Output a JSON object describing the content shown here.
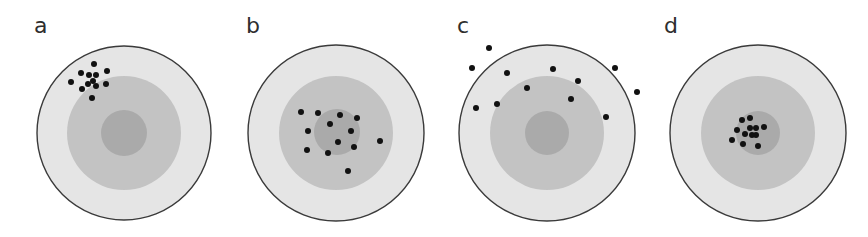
{
  "colors": {
    "outer_ring": "#e5e5e5",
    "middle_ring": "#c3c3c3",
    "inner_ring": "#aaaaaa",
    "outline": "#3a3a3a",
    "dot": "#111111",
    "label": "#2e2e2e"
  },
  "targets": [
    {
      "label": "a",
      "label_pos": [
        34,
        33
      ],
      "center": [
        124,
        133
      ],
      "r_outer": 87,
      "r_middle": 57,
      "r_inner": 23,
      "dots": [
        [
          94,
          64
        ],
        [
          81,
          73
        ],
        [
          89,
          75
        ],
        [
          96,
          75
        ],
        [
          107,
          71
        ],
        [
          71,
          82
        ],
        [
          93,
          81
        ],
        [
          88,
          84
        ],
        [
          96,
          86
        ],
        [
          106,
          84
        ],
        [
          82,
          89
        ],
        [
          92,
          98
        ]
      ]
    },
    {
      "label": "b",
      "label_pos": [
        246,
        33
      ],
      "center": [
        336,
        133
      ],
      "r_outer": 88,
      "r_middle": 57,
      "r_inner": 23,
      "inner_center": [
        337,
        132
      ],
      "dots": [
        [
          301,
          112
        ],
        [
          318,
          113
        ],
        [
          340,
          115
        ],
        [
          357,
          118
        ],
        [
          330,
          124
        ],
        [
          308,
          131
        ],
        [
          351,
          131
        ],
        [
          380,
          141
        ],
        [
          338,
          142
        ],
        [
          354,
          147
        ],
        [
          307,
          150
        ],
        [
          328,
          153
        ],
        [
          348,
          171
        ]
      ]
    },
    {
      "label": "c",
      "label_pos": [
        457,
        33
      ],
      "center": [
        547,
        133
      ],
      "r_outer": 88,
      "r_middle": 57,
      "r_inner": 22,
      "dots": [
        [
          489,
          48
        ],
        [
          472,
          68
        ],
        [
          507,
          73
        ],
        [
          553,
          69
        ],
        [
          615,
          68
        ],
        [
          578,
          81
        ],
        [
          527,
          88
        ],
        [
          637,
          92
        ],
        [
          476,
          108
        ],
        [
          497,
          104
        ],
        [
          571,
          99
        ],
        [
          606,
          117
        ]
      ]
    },
    {
      "label": "d",
      "label_pos": [
        664,
        33
      ],
      "center": [
        758,
        133
      ],
      "r_outer": 88,
      "r_middle": 57,
      "r_inner": 22,
      "dots": [
        [
          742,
          120
        ],
        [
          750,
          118
        ],
        [
          737,
          130
        ],
        [
          745,
          134
        ],
        [
          750,
          128
        ],
        [
          756,
          128
        ],
        [
          764,
          127
        ],
        [
          752,
          135
        ],
        [
          756,
          135
        ],
        [
          732,
          140
        ],
        [
          743,
          144
        ],
        [
          758,
          146
        ]
      ]
    }
  ]
}
